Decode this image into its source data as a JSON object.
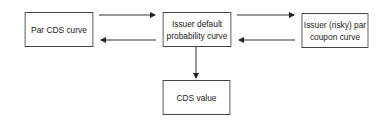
{
  "nodes": {
    "par_cds_curve": {
      "label": "Par CDS curve"
    },
    "issuer_default_probability_curve": {
      "label": "Issuer default probability curve"
    },
    "issuer_risky_par_coupon_curve": {
      "label": "Issuer (risky) par coupon curve"
    },
    "cds_value": {
      "label": "CDS value"
    }
  },
  "edges": [
    {
      "from": "Par CDS curve",
      "to": "Issuer default probability curve"
    },
    {
      "from": "Issuer default probability curve",
      "to": "Par CDS curve"
    },
    {
      "from": "Issuer default probability curve",
      "to": "Issuer (risky) par coupon curve"
    },
    {
      "from": "Issuer (risky) par coupon curve",
      "to": "Issuer default probability curve"
    },
    {
      "from": "Issuer default probability curve",
      "to": "CDS value"
    }
  ]
}
